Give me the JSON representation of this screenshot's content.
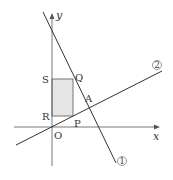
{
  "diagram": {
    "type": "coordinate-geometry",
    "axes": {
      "x_label": "x",
      "y_label": "y",
      "origin_label": "O"
    },
    "lines": [
      {
        "id": "line-1",
        "label": "①",
        "x1": 43,
        "y1": 12,
        "x2": 116,
        "y2": 163
      },
      {
        "id": "line-2",
        "label": "②",
        "x1": 16,
        "y1": 145,
        "x2": 162,
        "y2": 71
      }
    ],
    "points": {
      "S": {
        "label": "S",
        "x": 52,
        "y": 79
      },
      "Q": {
        "label": "Q",
        "x": 73,
        "y": 79
      },
      "R": {
        "label": "R",
        "x": 52,
        "y": 116
      },
      "P": {
        "label": "P",
        "x": 73,
        "y": 116
      },
      "A": {
        "label": "A",
        "x": 88,
        "y": 104
      }
    },
    "rectangle": {
      "vertices": [
        "S",
        "Q",
        "P",
        "R"
      ],
      "fill": "#e6e6e6",
      "stroke": "#555555"
    },
    "colors": {
      "line": "#333333",
      "axis": "#555555"
    }
  }
}
